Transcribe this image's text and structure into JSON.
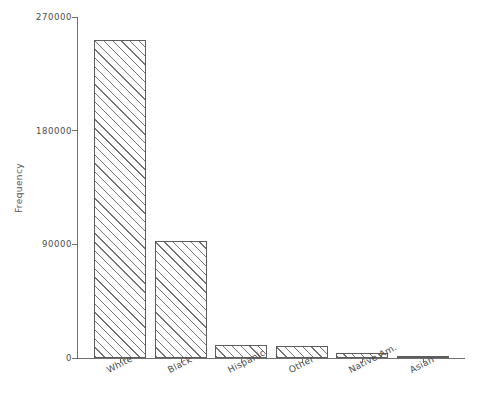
{
  "chart_data": {
    "type": "bar",
    "title": "",
    "xlabel": "",
    "ylabel": "Frequency",
    "categories": [
      "White",
      "Black",
      "Hispanic",
      "Other",
      "Native Am.",
      "Asian"
    ],
    "values": [
      252000,
      92700,
      10300,
      9500,
      4000,
      1500
    ],
    "ylim": [
      0,
      270000
    ],
    "ytick_labels": [
      "0",
      "90000",
      "180000",
      "270000"
    ],
    "ytick_values": [
      0,
      90000,
      180000,
      270000
    ],
    "grid": false,
    "legend": null,
    "bar_style": {
      "fill": "diagonal-hatch",
      "edge_color": "#5d5d5d",
      "face_color": "#ffffff"
    }
  },
  "axes": {
    "y_title": "Frequency"
  }
}
